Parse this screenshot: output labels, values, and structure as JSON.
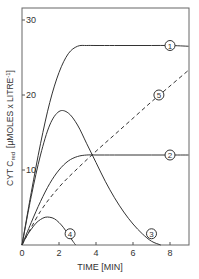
{
  "chart_data": {
    "type": "line",
    "title": "",
    "xlabel": "TIME [MIN]",
    "ylabel": "CYT Cred [µMOLES x LITRE⁻¹]",
    "ylabel_parts": {
      "main": "CYT C",
      "subscript": "red",
      "units": "[µMOLES x LITRE",
      "exp": "-1",
      "close": "]"
    },
    "xlim": [
      0,
      9
    ],
    "ylim": [
      0,
      32
    ],
    "xticks": [
      0,
      2,
      4,
      6,
      8
    ],
    "xtick_labels": [
      "0",
      "2",
      "4",
      "6",
      "8"
    ],
    "yticks": [
      10,
      20,
      30
    ],
    "ytick_labels": [
      "10",
      "20",
      "30"
    ],
    "grid": false,
    "legend": "circled numeric labels on curves",
    "colors": {
      "line": "#333333",
      "axis": "#555555"
    },
    "series": [
      {
        "name": "1",
        "style": "solid",
        "x": [
          0,
          0.5,
          1,
          1.5,
          2,
          2.5,
          3,
          3.5,
          4,
          5,
          6,
          7,
          8,
          9
        ],
        "y": [
          0,
          7,
          13.5,
          19,
          23,
          25.5,
          26.5,
          26.6,
          26.6,
          26.6,
          26.6,
          26.6,
          26.6,
          26.5
        ],
        "label_pos": [
          8.0,
          26.6
        ]
      },
      {
        "name": "2",
        "style": "solid",
        "x": [
          0,
          0.5,
          1,
          1.5,
          2,
          2.5,
          3,
          3.5,
          4,
          5,
          6,
          7,
          8,
          9
        ],
        "y": [
          0,
          3,
          5.8,
          8.2,
          10,
          11.2,
          11.8,
          12,
          12,
          12,
          12,
          12,
          12,
          12
        ],
        "label_pos": [
          8.0,
          12
        ]
      },
      {
        "name": "3",
        "style": "solid",
        "x": [
          0,
          0.5,
          1,
          1.5,
          2,
          2.5,
          3,
          3.5,
          4,
          4.5,
          5,
          5.5,
          6,
          6.5,
          7,
          7.5
        ],
        "y": [
          0,
          6.5,
          12,
          16,
          17.8,
          17.6,
          16,
          13.5,
          11,
          8.5,
          6.3,
          4.4,
          2.8,
          1.5,
          0.5,
          0
        ],
        "label_pos": [
          7.0,
          1.5
        ]
      },
      {
        "name": "4",
        "style": "solid",
        "x": [
          0,
          0.25,
          0.5,
          0.75,
          1,
          1.25,
          1.5,
          1.75,
          2,
          2.25,
          2.5,
          2.75,
          2.9
        ],
        "y": [
          0,
          1.2,
          2.1,
          2.9,
          3.4,
          3.7,
          3.7,
          3.5,
          3.0,
          2.3,
          1.4,
          0.5,
          0
        ],
        "label_pos": [
          2.6,
          1.5
        ]
      },
      {
        "name": "5",
        "style": "dashed",
        "x": [
          0,
          1,
          2,
          3,
          4,
          5,
          6,
          7,
          8,
          9
        ],
        "y": [
          0,
          4.5,
          7.7,
          10.2,
          12.5,
          14.7,
          16.9,
          19.1,
          21.2,
          23.3
        ],
        "label_pos": [
          7.4,
          20.0
        ]
      }
    ]
  }
}
